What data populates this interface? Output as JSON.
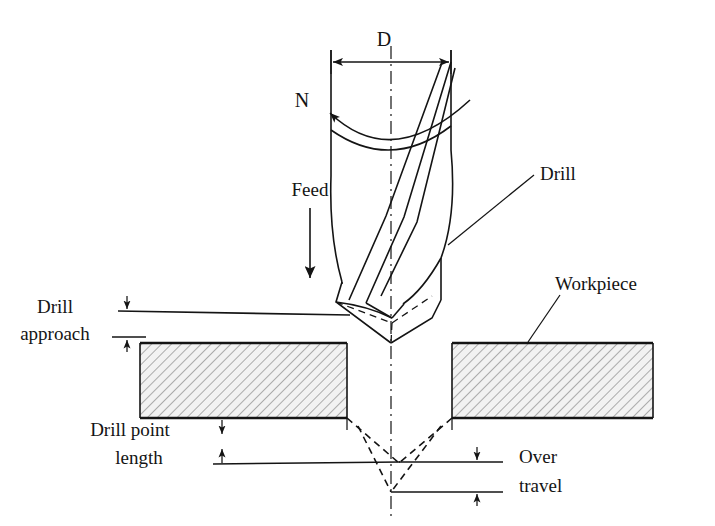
{
  "figure": {
    "colors": {
      "line": "#141414",
      "hatch": "#9a9a9a",
      "hatch_fill": "#efefef",
      "background": "#ffffff"
    }
  },
  "labels": {
    "diameter": "D",
    "speed": "N",
    "feed": "Feed",
    "drill": "Drill",
    "workpiece": "Workpiece",
    "drill_approach_line1": "Drill",
    "drill_approach_line2": "approach",
    "drill_point_line1": "Drill point",
    "drill_point_line2": "length",
    "over_travel_line1": "Over",
    "over_travel_line2": "travel"
  },
  "dimensions": {
    "diameter": {
      "name": "D",
      "y": 62,
      "x_start": 331,
      "x_end": 451
    },
    "drill_approach": {
      "name": "Drill approach",
      "x": 127,
      "y_top": 303,
      "y_bottom": 343
    },
    "drill_point_length": {
      "name": "Drill point length",
      "x": 222,
      "y_top": 420,
      "y_bottom": 463
    },
    "over_travel": {
      "name": "Over travel",
      "x": 477,
      "y_top": 462,
      "y_bottom": 492
    }
  },
  "geometry": {
    "drill_axis_x": 391,
    "drill_body_left": 331,
    "drill_body_right": 451,
    "drill_tip_y": 343,
    "workpiece": {
      "left": 140,
      "right": 653,
      "top": 343,
      "bottom": 418
    },
    "hole": {
      "left": 347,
      "right": 452
    },
    "hole_cone_outer_tip_y": 463,
    "hole_cone_inner_tip_y": 492
  }
}
